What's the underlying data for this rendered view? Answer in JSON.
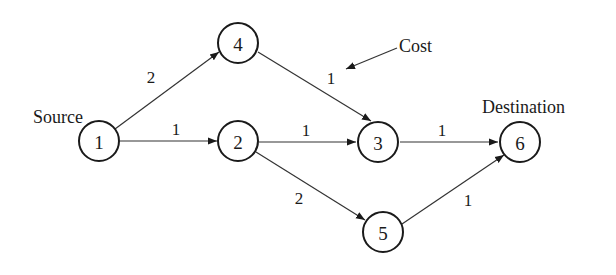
{
  "diagram": {
    "type": "directed-weighted-graph",
    "annotations": {
      "source": "Source",
      "destination": "Destination",
      "cost": "Cost"
    },
    "nodes": [
      {
        "id": "1",
        "label": "1",
        "x": 99,
        "y": 141
      },
      {
        "id": "2",
        "label": "2",
        "x": 238,
        "y": 141
      },
      {
        "id": "3",
        "label": "3",
        "x": 378,
        "y": 142
      },
      {
        "id": "4",
        "label": "4",
        "x": 238,
        "y": 43
      },
      {
        "id": "5",
        "label": "5",
        "x": 383,
        "y": 232
      },
      {
        "id": "6",
        "label": "6",
        "x": 520,
        "y": 142
      }
    ],
    "edges": [
      {
        "from": "1",
        "to": "4",
        "cost": "2"
      },
      {
        "from": "1",
        "to": "2",
        "cost": "1"
      },
      {
        "from": "4",
        "to": "3",
        "cost": "1"
      },
      {
        "from": "2",
        "to": "3",
        "cost": "1"
      },
      {
        "from": "2",
        "to": "5",
        "cost": "2"
      },
      {
        "from": "3",
        "to": "6",
        "cost": "1"
      },
      {
        "from": "5",
        "to": "6",
        "cost": "1"
      }
    ]
  }
}
